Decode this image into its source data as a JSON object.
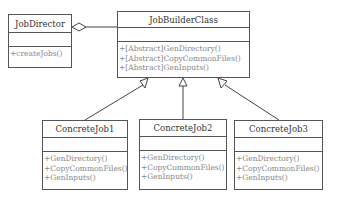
{
  "diagram": {
    "type": "uml-class",
    "classes": {
      "director": {
        "name": "JobDirector",
        "operations": [
          "+createJobs()"
        ]
      },
      "builder": {
        "name": "JobBuilderClass",
        "operations": [
          "+[Abstract]GenDirectory()",
          "+[Abstract]CopyCommonFiles()",
          "+[Abstract]GenInputs()"
        ]
      },
      "job1": {
        "name": "ConcreteJob1",
        "operations": [
          "+GenDirectory()",
          "+CopyCommonFiles()",
          "+GenInputs()"
        ]
      },
      "job2": {
        "name": "ConcreteJob2",
        "operations": [
          "+GenDirectory()",
          "+CopyCommonFiles()",
          "+GenInputs()"
        ]
      },
      "job3": {
        "name": "ConcreteJob3",
        "operations": [
          "+GenDirectory()",
          "+CopyCommonFiles()",
          "+GenInputs()"
        ]
      }
    },
    "relations": [
      {
        "from": "JobDirector",
        "to": "JobBuilderClass",
        "kind": "aggregation"
      },
      {
        "from": "ConcreteJob1",
        "to": "JobBuilderClass",
        "kind": "generalization"
      },
      {
        "from": "ConcreteJob2",
        "to": "JobBuilderClass",
        "kind": "generalization"
      },
      {
        "from": "ConcreteJob3",
        "to": "JobBuilderClass",
        "kind": "generalization"
      }
    ]
  }
}
